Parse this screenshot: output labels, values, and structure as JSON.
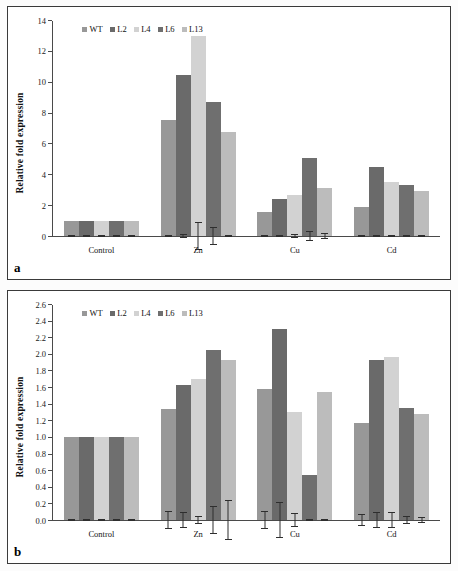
{
  "figure": {
    "background": "#fcfcfc",
    "frame_color": "#3a3a3a"
  },
  "series_colors": {
    "WT": "#989898",
    "L2": "#6a6a6a",
    "L4": "#d2d2d2",
    "L6": "#6f6f6f",
    "L13": "#bcbcbc"
  },
  "panels": [
    {
      "letter": "a",
      "ylabel": "Relative fold expression",
      "legend": [
        "WT",
        "L2",
        "L4",
        "L6",
        "L13"
      ],
      "yticks": [
        "0",
        "2",
        "4",
        "6",
        "8",
        "10",
        "12",
        "14"
      ],
      "chart_data": {
        "type": "bar",
        "title": "",
        "xlabel": "",
        "ylabel": "Relative fold expression",
        "ylim": [
          0,
          14
        ],
        "ytick_step": 2,
        "grid": false,
        "legend_position": "top-left",
        "categories": [
          "Control",
          "Zn",
          "Cu",
          "Cd"
        ],
        "series": [
          {
            "name": "WT",
            "values": [
              1.0,
              7.55,
              1.55,
              1.9
            ],
            "errors": [
              0.02,
              0.18,
              0.12,
              0.3
            ]
          },
          {
            "name": "L2",
            "values": [
              1.0,
              10.5,
              2.4,
              4.5
            ],
            "errors": [
              0.02,
              0.2,
              0.15,
              0.18
            ]
          },
          {
            "name": "L4",
            "values": [
              1.0,
              13.05,
              2.67,
              3.5
            ],
            "errors": [
              0.02,
              0.95,
              0.85,
              0.12
            ]
          },
          {
            "name": "L6",
            "values": [
              1.0,
              8.72,
              5.05,
              3.35
            ],
            "errors": [
              0.02,
              0.9,
              0.85,
              0.1
            ]
          },
          {
            "name": "L13",
            "values": [
              1.0,
              6.8,
              3.15,
              2.92
            ],
            "errors": [
              0.02,
              0.12,
              0.92,
              0.15
            ]
          }
        ]
      }
    },
    {
      "letter": "b",
      "ylabel": "Relative fold expression",
      "legend": [
        "WT",
        "L2",
        "L4",
        "L6",
        "L13"
      ],
      "yticks": [
        "0.0",
        "0.2",
        "0.4",
        "0.6",
        "0.8",
        "1.0",
        "1.2",
        "1.4",
        "1.6",
        "1.8",
        "2.0",
        "2.2",
        "2.4",
        "2.6"
      ],
      "chart_data": {
        "type": "bar",
        "title": "",
        "xlabel": "",
        "ylabel": "Relative fold expression",
        "ylim": [
          0,
          2.6
        ],
        "ytick_step": 0.2,
        "grid": false,
        "legend_position": "top-left",
        "categories": [
          "Control",
          "Zn",
          "Cu",
          "Cd"
        ],
        "series": [
          {
            "name": "WT",
            "values": [
              1.0,
              1.34,
              1.59,
              1.17
            ],
            "errors": [
              0.005,
              0.2,
              0.18,
              0.15
            ]
          },
          {
            "name": "L2",
            "values": [
              1.0,
              1.63,
              2.31,
              1.93
            ],
            "errors": [
              0.005,
              0.15,
              0.24,
              0.13
            ]
          },
          {
            "name": "L4",
            "values": [
              1.0,
              1.71,
              1.31,
              1.97
            ],
            "errors": [
              0.005,
              0.08,
              0.18,
              0.12
            ]
          },
          {
            "name": "L6",
            "values": [
              1.0,
              2.06,
              0.55,
              1.36
            ],
            "errors": [
              0.005,
              0.21,
              0.06,
              0.1
            ]
          },
          {
            "name": "L13",
            "values": [
              1.0,
              1.94,
              1.55,
              1.28
            ],
            "errors": [
              0.005,
              0.33,
              0.03,
              0.07
            ]
          }
        ]
      }
    }
  ]
}
